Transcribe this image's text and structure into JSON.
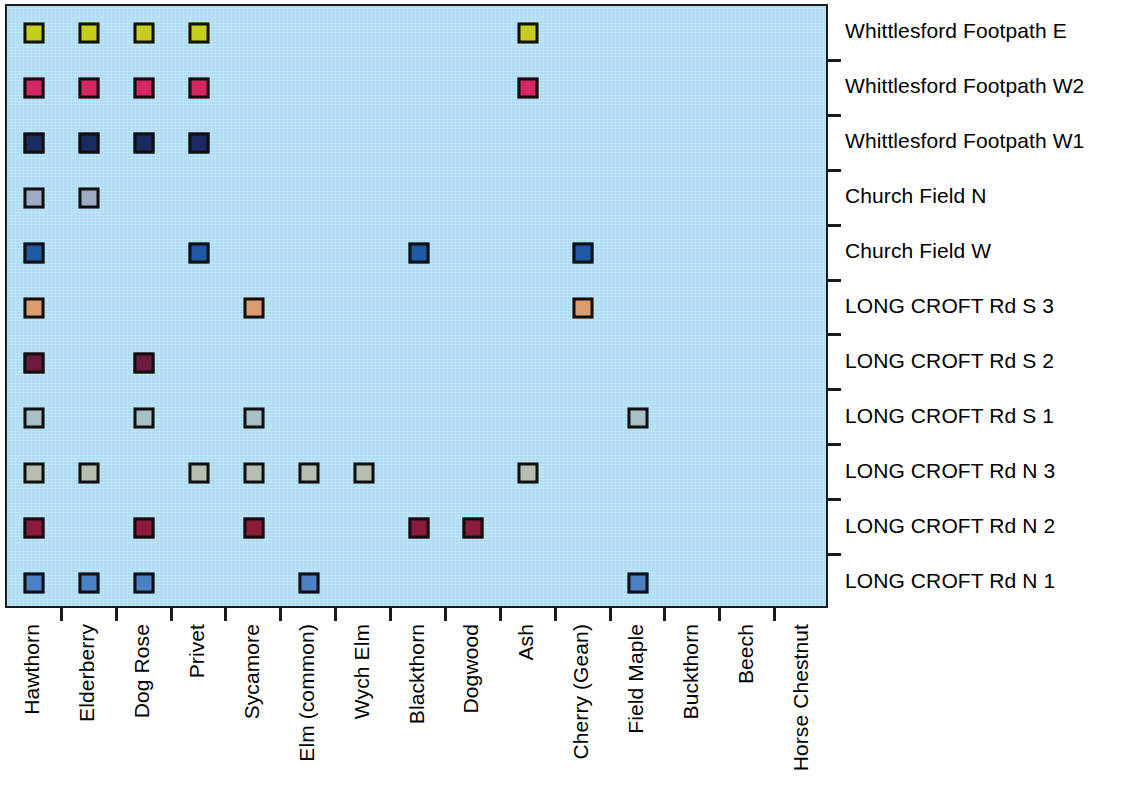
{
  "chart_data": {
    "type": "heatmap",
    "title": "",
    "subtitle": "",
    "xlabel": "",
    "ylabel": "",
    "grid": false,
    "legend_position": "none",
    "note": "Presence/absence matrix of hedgerow species recorded along survey sections. A coloured square marks presence of the species (column) in that survey section (row). Each row has its own colour.",
    "categories": [
      "Hawthorn",
      "Elderberry",
      "Dog Rose",
      "Privet",
      "Sycamore",
      "Elm (common)",
      "Wych Elm",
      "Blackthorn",
      "Dogwood",
      "Ash",
      "Cherry (Gean)",
      "Field Maple",
      "Buckthorn",
      "Beech",
      "Horse Chestnut"
    ],
    "row_labels": [
      "Whittlesford Footpath E",
      "Whittlesford Footpath W2",
      "Whittlesford Footpath W1",
      "Church Field N",
      "Church Field W",
      "LONG CROFT Rd S 3",
      "LONG CROFT Rd S 2",
      "LONG CROFT Rd S 1",
      "LONG CROFT Rd N 3",
      "LONG CROFT Rd N 2",
      "LONG CROFT Rd N 1"
    ],
    "series": [
      {
        "name": "Whittlesford Footpath E",
        "color": "#c6ce1d",
        "values": [
          1,
          1,
          1,
          1,
          0,
          0,
          0,
          0,
          0,
          1,
          0,
          0,
          0,
          0,
          0
        ],
        "present": [
          "Hawthorn",
          "Elderberry",
          "Dog Rose",
          "Privet",
          "Ash"
        ]
      },
      {
        "name": "Whittlesford Footpath W2",
        "color": "#d42663",
        "values": [
          1,
          1,
          1,
          1,
          0,
          0,
          0,
          0,
          0,
          1,
          0,
          0,
          0,
          0,
          0
        ],
        "present": [
          "Hawthorn",
          "Elderberry",
          "Dog Rose",
          "Privet",
          "Ash"
        ]
      },
      {
        "name": "Whittlesford Footpath W1",
        "color": "#1b2a60",
        "values": [
          1,
          1,
          1,
          1,
          0,
          0,
          0,
          0,
          0,
          0,
          0,
          0,
          0,
          0,
          0
        ],
        "present": [
          "Hawthorn",
          "Elderberry",
          "Dog Rose",
          "Privet"
        ]
      },
      {
        "name": "Church Field N",
        "color": "#9fabc4",
        "values": [
          1,
          1,
          0,
          0,
          0,
          0,
          0,
          0,
          0,
          0,
          0,
          0,
          0,
          0,
          0
        ],
        "present": [
          "Hawthorn",
          "Elderberry"
        ]
      },
      {
        "name": "Church Field W",
        "color": "#1f5aa6",
        "values": [
          1,
          0,
          0,
          1,
          0,
          0,
          0,
          1,
          0,
          0,
          1,
          0,
          0,
          0,
          0
        ],
        "present": [
          "Hawthorn",
          "Privet",
          "Blackthorn",
          "Cherry (Gean)"
        ]
      },
      {
        "name": "LONG CROFT Rd S 3",
        "color": "#dc9d6e",
        "values": [
          1,
          0,
          0,
          0,
          1,
          0,
          0,
          0,
          0,
          0,
          1,
          0,
          0,
          0,
          0
        ],
        "present": [
          "Hawthorn",
          "Sycamore",
          "Cherry (Gean)"
        ]
      },
      {
        "name": "LONG CROFT Rd S 2",
        "color": "#6d1940",
        "values": [
          1,
          0,
          1,
          0,
          0,
          0,
          0,
          0,
          0,
          0,
          0,
          0,
          0,
          0,
          0
        ],
        "present": [
          "Hawthorn",
          "Dog Rose"
        ]
      },
      {
        "name": "LONG CROFT Rd S 1",
        "color": "#a7c0c6",
        "values": [
          1,
          0,
          1,
          0,
          1,
          0,
          0,
          0,
          0,
          0,
          0,
          1,
          0,
          0,
          0
        ],
        "present": [
          "Hawthorn",
          "Dog Rose",
          "Sycamore",
          "Field Maple"
        ]
      },
      {
        "name": "LONG CROFT Rd N 3",
        "color": "#b5beb0",
        "values": [
          1,
          1,
          0,
          1,
          1,
          1,
          1,
          0,
          0,
          1,
          0,
          0,
          0,
          0,
          0
        ],
        "present": [
          "Hawthorn",
          "Elderberry",
          "Privet",
          "Sycamore",
          "Elm (common)",
          "Wych Elm",
          "Ash"
        ]
      },
      {
        "name": "LONG CROFT Rd N 2",
        "color": "#8d1a3c",
        "values": [
          1,
          0,
          1,
          0,
          1,
          0,
          0,
          1,
          1,
          0,
          0,
          0,
          0,
          0,
          0
        ],
        "present": [
          "Hawthorn",
          "Dog Rose",
          "Sycamore",
          "Blackthorn",
          "Dogwood"
        ]
      },
      {
        "name": "LONG CROFT Rd N 1",
        "color": "#4b80c2",
        "values": [
          1,
          1,
          1,
          0,
          0,
          1,
          0,
          0,
          0,
          0,
          0,
          1,
          0,
          0,
          0
        ],
        "present": [
          "Hawthorn",
          "Elderberry",
          "Dog Rose",
          "Elm (common)",
          "Field Maple"
        ]
      }
    ],
    "colors": {
      "panel_background": "#addcf3",
      "axis": "#1b1b1b",
      "marker_border": "#101010",
      "text": "#000000"
    }
  }
}
